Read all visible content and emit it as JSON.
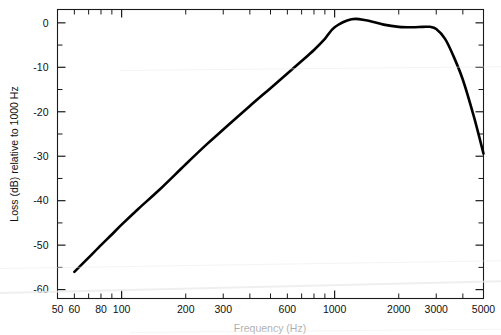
{
  "figure": {
    "background_color": "#ffffff",
    "curve_color": "#000000",
    "axis_color": "#1a1a1a"
  },
  "axes": {
    "x_title": "Frequency (Hz)",
    "y_title": "Loss (dB) relative to 1000 Hz",
    "x_tick_labels": [
      "50",
      "60",
      "80",
      "100",
      "200",
      "300",
      "600",
      "1000",
      "2000",
      "3000",
      "5000"
    ],
    "y_tick_labels": [
      "0",
      "-10",
      "-20",
      "-30",
      "-40",
      "-50",
      "-60"
    ]
  },
  "chart_data": {
    "type": "line",
    "title": "",
    "xlabel": "Frequency (Hz)",
    "ylabel": "Loss (dB) relative to 1000 Hz",
    "xscale": "log",
    "yscale": "linear",
    "xlim": [
      50,
      5000
    ],
    "ylim": [
      -62,
      3
    ],
    "grid": false,
    "legend": "none",
    "x_ticks": [
      50,
      60,
      80,
      100,
      200,
      300,
      600,
      1000,
      2000,
      3000,
      5000
    ],
    "x_tick_labels": [
      "50",
      "60",
      "80",
      "100",
      "200",
      "300",
      "600",
      "1000",
      "2000",
      "3000",
      "5000"
    ],
    "y_ticks": [
      0,
      -10,
      -20,
      -30,
      -40,
      -50,
      -60
    ],
    "y_tick_labels": [
      "0",
      "-10",
      "-20",
      "-30",
      "-40",
      "-50",
      "-60"
    ],
    "y_minor_tick_step": 5,
    "series": [
      {
        "name": "Loss relative to 1000 Hz",
        "color": "#000000",
        "x": [
          60,
          70,
          80,
          90,
          100,
          120,
          150,
          200,
          250,
          300,
          400,
          500,
          600,
          700,
          800,
          900,
          1000,
          1200,
          1400,
          1700,
          2000,
          2300,
          2600,
          2800,
          3000,
          3300,
          3600,
          4000,
          4500,
          5000
        ],
        "y": [
          -56.0,
          -52.8,
          -50.0,
          -47.6,
          -45.4,
          -41.8,
          -37.6,
          -31.8,
          -27.4,
          -24.0,
          -18.7,
          -14.7,
          -11.4,
          -8.6,
          -6.1,
          -3.6,
          -1.0,
          0.8,
          0.6,
          -0.4,
          -0.9,
          -1.0,
          -0.9,
          -0.9,
          -1.4,
          -3.6,
          -7.3,
          -12.8,
          -21.0,
          -29.4
        ]
      }
    ]
  }
}
